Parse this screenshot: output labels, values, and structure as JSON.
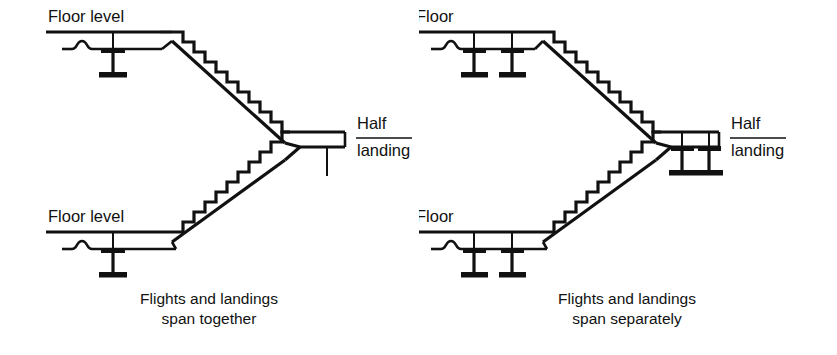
{
  "figure": {
    "kind": "architectural-section-diagram",
    "background_color": "#ffffff",
    "ink_color": "#111111"
  },
  "diagrams": [
    {
      "id": "span-together",
      "position": "left",
      "caption": "Flights and landings\nspan together",
      "caption_line1": "Flights and landings",
      "caption_line2": "span together",
      "upper_floor_label": "Floor level",
      "lower_floor_label": "Floor level",
      "landing_label_top": "Half",
      "landing_label_bottom": "landing",
      "upper_floor_columns": 1,
      "lower_floor_columns": 1,
      "landing_columns": 0,
      "landing_support": "continuous-slab-stub",
      "steps_upper_flight": 10,
      "steps_lower_flight": 10
    },
    {
      "id": "span-separately",
      "position": "right",
      "caption": "Flights and landings\nspan separately",
      "caption_line1": "Flights and landings",
      "caption_line2": "span separately",
      "upper_floor_label": "Floor",
      "lower_floor_label": "Floor",
      "landing_label_top": "Half",
      "landing_label_bottom": "landing",
      "upper_floor_columns": 2,
      "lower_floor_columns": 2,
      "landing_columns": 2,
      "landing_support": "twin-columns",
      "steps_upper_flight": 10,
      "steps_lower_flight": 10
    }
  ]
}
